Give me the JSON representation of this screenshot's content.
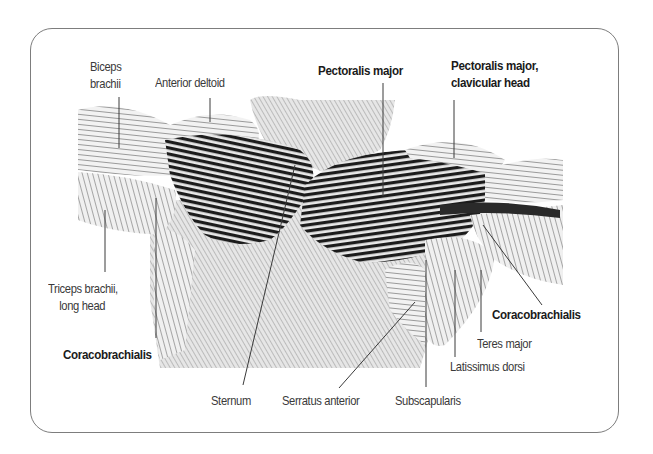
{
  "diagram": {
    "labels": {
      "biceps_brachii": {
        "line1": "Biceps",
        "line2": "brachii",
        "bold": false
      },
      "anterior_deltoid": {
        "text": "Anterior deltoid",
        "bold": false
      },
      "pectoralis_major": {
        "text": "Pectoralis major",
        "bold": true
      },
      "pectoralis_major_clavicular": {
        "line1": "Pectoralis major,",
        "line2": "clavicular head",
        "bold": true
      },
      "triceps_brachii_long_head": {
        "line1": "Triceps brachii,",
        "line2": "long head",
        "bold": false
      },
      "coracobrachialis_left": {
        "text": "Coracobrachialis",
        "bold": true
      },
      "coracobrachialis_right": {
        "text": "Coracobrachialis",
        "bold": true
      },
      "teres_major": {
        "text": "Teres major",
        "bold": false
      },
      "latissimus_dorsi": {
        "text": "Latissimus dorsi",
        "bold": false
      },
      "sternum": {
        "text": "Sternum",
        "bold": false
      },
      "serratus_anterior": {
        "text": "Serratus anterior",
        "bold": false
      },
      "subscapularis": {
        "text": "Subscapularis",
        "bold": false
      }
    },
    "colors": {
      "frame": "#7d7d7d",
      "leader_line": "#3a3a3a",
      "muscle_dark": "#1e1e1e",
      "muscle_light": "#d9d9d9",
      "skin_shade": "#bdbdbd"
    }
  }
}
